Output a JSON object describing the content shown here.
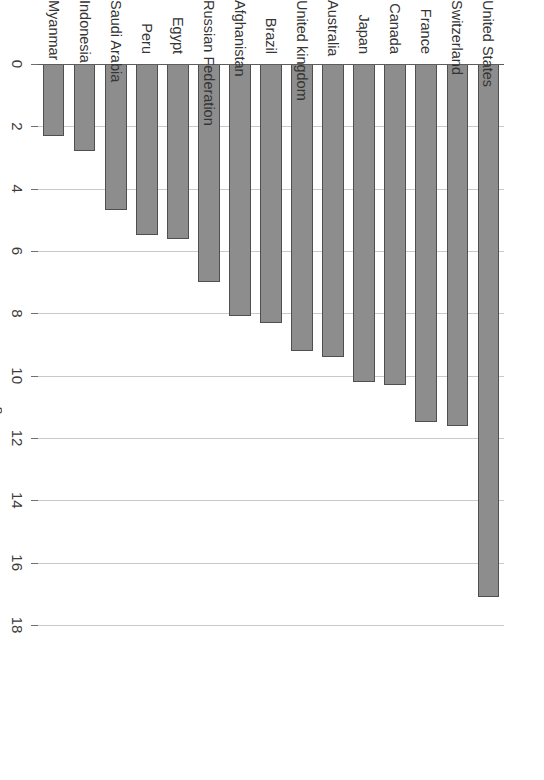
{
  "chart_data": {
    "type": "bar",
    "title": "",
    "subtitle": "",
    "orientation": "vertical-rotated-90",
    "categories": [
      "United States",
      "Switzerland",
      "France",
      "Canada",
      "Japan",
      "Australia",
      "United kingdom",
      "Brazil",
      "Afghanistan",
      "Russian Federation",
      "Egypt",
      "Peru",
      "Saudi Arabia",
      "Indonesia",
      "Myanmar"
    ],
    "values": [
      17.1,
      11.6,
      11.5,
      10.3,
      10.2,
      9.4,
      9.2,
      8.3,
      8.1,
      7.0,
      5.6,
      5.5,
      4.7,
      2.8,
      2.3
    ],
    "xlabel": "",
    "ylabel": "Percentage of Gross Domestic Product",
    "ylim": [
      0,
      18
    ],
    "ytick_labels": [
      "0",
      "2",
      "4",
      "6",
      "8",
      "10",
      "12",
      "14",
      "16",
      "18"
    ],
    "ytick_values": [
      0,
      2,
      4,
      6,
      8,
      10,
      12,
      14,
      16,
      18
    ],
    "grid": true,
    "legend": false,
    "bar_color": "#8d8d8d",
    "bar_border_color": "#4f4f4f",
    "gridline_color": "#c8c8c8",
    "axis_color": "#5d5d5d",
    "background": "#ffffff"
  },
  "axis": {
    "value_axis_title": "Percentage of Gross Domestic Product"
  }
}
